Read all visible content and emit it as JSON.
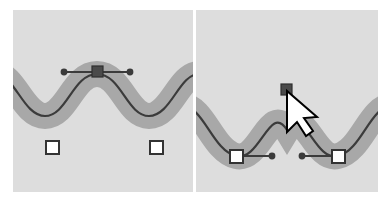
{
  "figure": {
    "name": "bezier-node-type-comparison",
    "background_color": "#ffffff",
    "panel_background_color": "#dddddd",
    "stroke_band_color": "#a8a8a8",
    "path_line_color": "#3b3b3b",
    "handle_line_color": "#3b3b3b",
    "anchor_fill_color": "#ffffff",
    "anchor_stroke_color": "#333333",
    "selected_node_fill_color": "#4a4a4a",
    "cursor_fill_color": "#ffffff",
    "cursor_stroke_color": "#000000",
    "panels": [
      {
        "id": "panel-before",
        "caption": "",
        "node_type": "smooth",
        "peak_node_label": "smooth-node",
        "handles": [
          {
            "label": "left-control-handle",
            "kind": "round-dot"
          },
          {
            "label": "right-control-handle",
            "kind": "round-dot"
          }
        ],
        "anchors": [
          {
            "label": "left-anchor",
            "kind": "square"
          },
          {
            "label": "right-anchor",
            "kind": "square"
          }
        ],
        "cursor_visible": false
      },
      {
        "id": "panel-after",
        "caption": "",
        "node_type": "cusp",
        "peak_node_label": "cusp-node",
        "handles": [
          {
            "label": "left-anchor-outgoing-handle",
            "kind": "round-dot"
          },
          {
            "label": "right-anchor-incoming-handle",
            "kind": "round-dot"
          }
        ],
        "anchors": [
          {
            "label": "left-anchor",
            "kind": "square"
          },
          {
            "label": "right-anchor",
            "kind": "square"
          }
        ],
        "cursor_visible": true,
        "cursor_label": "arrow-pointer"
      }
    ]
  },
  "geometry": {
    "panel_before": {
      "path_d": "M -12 120 C 8 120 16 78 38 78 C 60 78 66 120 90 120 C 114 120 120 78 142 78 C 164 78 172 120 192 120",
      "band_width": 26,
      "line_width": 2.2,
      "peak_node": {
        "x": 90,
        "y": 120
      },
      "handle_left": {
        "x": 57,
        "y": 120
      },
      "handle_right": {
        "x": 123,
        "y": 120
      },
      "anchor_left": {
        "x": 38,
        "y": 78
      },
      "anchor_right": {
        "x": 142,
        "y": 78
      }
    },
    "panel_after": {
      "path_d": "M -14 100 C 6 100 12 62 34 58 C 56 54 70 102 90 70 C 110 102 124 54 146 58 C 168 62 174 100 194 100",
      "band_width": 26,
      "line_width": 2.2,
      "peak_node": {
        "x": 90,
        "y": 70
      },
      "anchor_left": {
        "x": 34,
        "y": 58
      },
      "anchor_right": {
        "x": 146,
        "y": 58
      },
      "handle_left_end": {
        "x": 70,
        "y": 58
      },
      "handle_right_end": {
        "x": 110,
        "y": 58
      },
      "cursor_tip": {
        "x": 92,
        "y": 74
      }
    }
  }
}
